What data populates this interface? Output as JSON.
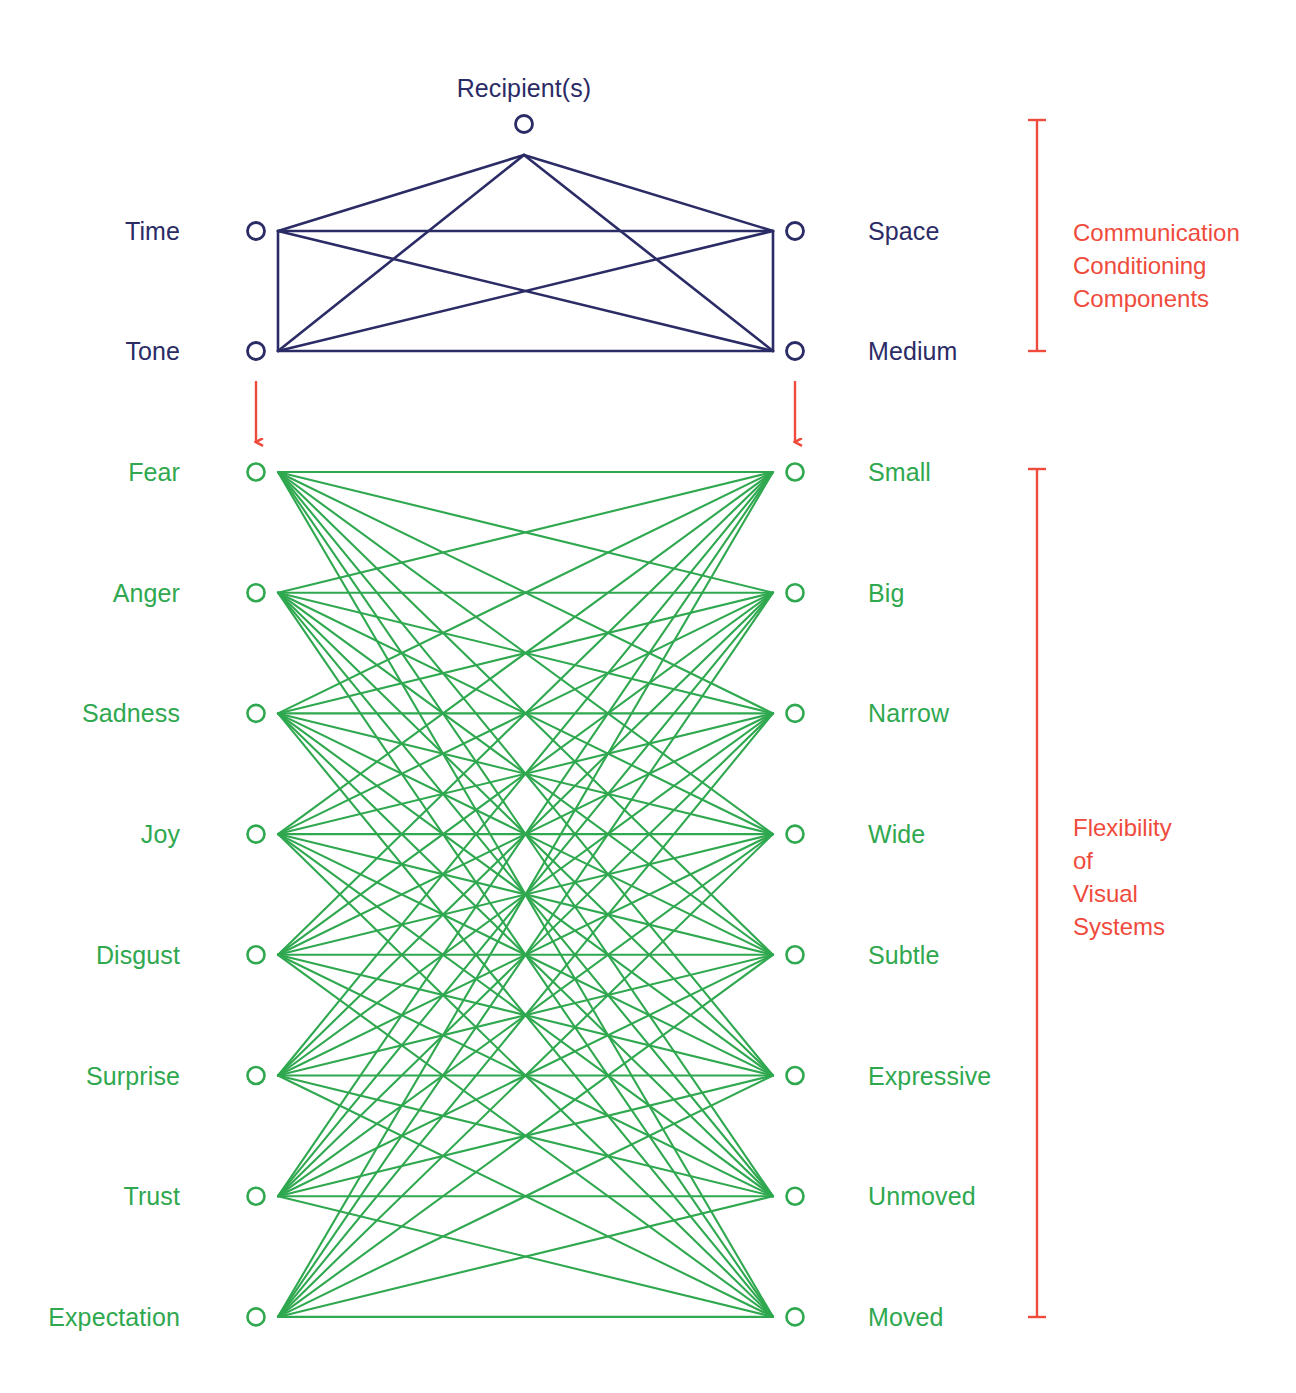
{
  "canvas": {
    "width": 1296,
    "height": 1393,
    "background": "#ffffff"
  },
  "colors": {
    "navy": "#2b2b66",
    "green": "#2fa84f",
    "red": "#ef4b3c",
    "white": "#ffffff"
  },
  "top_group": {
    "title": "Recipient(s)",
    "nodes": {
      "recipient": "Recipient(s)",
      "left_top": "Time",
      "left_bottom": "Tone",
      "right_top": "Space",
      "right_bottom": "Medium"
    },
    "left_labels": [
      "Time",
      "Tone"
    ],
    "right_labels": [
      "Space",
      "Medium"
    ],
    "annotation": "Communication\nConditioning\nComponents",
    "annotation_lines": [
      "Communication",
      "Conditioning",
      "Components"
    ]
  },
  "bottom_group": {
    "left_labels": [
      "Fear",
      "Anger",
      "Sadness",
      "Joy",
      "Disgust",
      "Surprise",
      "Trust",
      "Expectation"
    ],
    "right_labels": [
      "Small",
      "Big",
      "Narrow",
      "Wide",
      "Subtle",
      "Expressive",
      "Unmoved",
      "Moved"
    ],
    "annotation": "Flexibility\nof\nVisual\nSystems",
    "annotation_lines": [
      "Flexibility",
      "of",
      "Visual",
      "Systems"
    ]
  },
  "arrows": {
    "left_arrow_name": "tone-to-fear-arrow",
    "right_arrow_name": "medium-to-small-arrow"
  },
  "chart_data": {
    "type": "diagram",
    "subtype": "bipartite-network",
    "title": "Recipient(s)",
    "groups": [
      {
        "name": "Communication Conditioning Components",
        "color": "#2b2b66",
        "apex": "Recipient(s)",
        "left_nodes": [
          "Time",
          "Tone"
        ],
        "right_nodes": [
          "Space",
          "Medium"
        ],
        "edges_complete_bipartite": true,
        "apex_connects_to_all": true,
        "left_column_vertical_edge": true,
        "right_column_vertical_edge": true
      },
      {
        "name": "Flexibility of Visual Systems",
        "color": "#2fa84f",
        "left_nodes": [
          "Fear",
          "Anger",
          "Sadness",
          "Joy",
          "Disgust",
          "Surprise",
          "Trust",
          "Expectation"
        ],
        "right_nodes": [
          "Small",
          "Big",
          "Narrow",
          "Wide",
          "Subtle",
          "Expressive",
          "Unmoved",
          "Moved"
        ],
        "edges_complete_bipartite": true,
        "edge_count": 64
      }
    ],
    "connectors": [
      {
        "from": "Tone",
        "to": "Fear",
        "color": "#ef4b3c",
        "style": "arrow-down"
      },
      {
        "from": "Medium",
        "to": "Small",
        "color": "#ef4b3c",
        "style": "arrow-down"
      }
    ]
  }
}
